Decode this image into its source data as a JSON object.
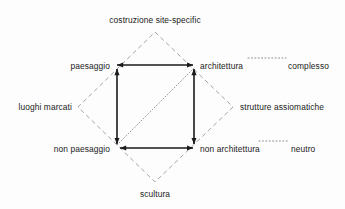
{
  "diagram": {
    "type": "semiotic-square",
    "title_text": null,
    "background_color": "#fdfdfd",
    "text_color": "#1b1b1b",
    "solid_line_color": "#1a1a1a",
    "dashed_line_color": "#9a9a9a",
    "dotted_line_color": "#8d8d8d",
    "outer_diamond": {
      "style": "dashed",
      "vertices": {
        "top": {
          "x": 155,
          "y": 32
        },
        "right": {
          "x": 233,
          "y": 107
        },
        "bottom": {
          "x": 155,
          "y": 182
        },
        "left": {
          "x": 78,
          "y": 107
        }
      }
    },
    "inner_square": {
      "style": "solid-double-arrow",
      "corners": {
        "top_left": {
          "x": 114,
          "y": 65
        },
        "top_right": {
          "x": 196,
          "y": 65
        },
        "bottom_right": {
          "x": 196,
          "y": 148
        },
        "bottom_left": {
          "x": 114,
          "y": 148
        }
      }
    },
    "diagonal": {
      "style": "dotted",
      "from": "non paesaggio",
      "to": "architettura"
    },
    "corner_labels": [
      {
        "id": "paesaggio",
        "text": "paesaggio",
        "x": 108,
        "y": 61,
        "align": "right"
      },
      {
        "id": "architettura",
        "text": "architettura",
        "x": 201,
        "y": 61,
        "align": "left"
      },
      {
        "id": "non-paesaggio",
        "text": "non paesaggio",
        "x": 108,
        "y": 144,
        "align": "right"
      },
      {
        "id": "non-architettura",
        "text": "non architettura",
        "x": 201,
        "y": 144,
        "align": "left"
      }
    ],
    "vertex_labels": [
      {
        "id": "costruzione-site-specific",
        "text": "costruzione site-specific",
        "x": 155,
        "y": 15,
        "align": "center"
      },
      {
        "id": "scultura",
        "text": "scultura",
        "x": 155,
        "y": 189,
        "align": "center"
      },
      {
        "id": "luoghi-marcati",
        "text": "luoghi marcati",
        "x": 72,
        "y": 102,
        "align": "right"
      },
      {
        "id": "strutture-assiomatiche",
        "text": "strutture assiomatiche",
        "x": 240,
        "y": 102,
        "align": "left"
      }
    ],
    "side_labels": [
      {
        "id": "complesso",
        "text": "complesso",
        "x": 290,
        "y": 61,
        "align": "left",
        "connector": "dotted",
        "connected_to": "architettura"
      },
      {
        "id": "neutro",
        "text": "neutro",
        "x": 293,
        "y": 144,
        "align": "left",
        "connector": "dotted",
        "connected_to": "non architettura"
      }
    ]
  }
}
